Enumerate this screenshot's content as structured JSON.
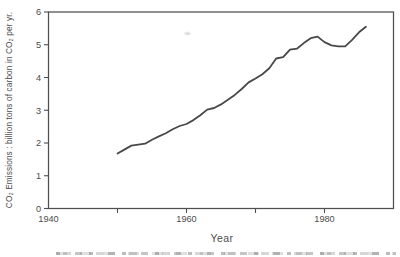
{
  "colors": {
    "paper": "#ffffff",
    "ink": "#4c4c4c",
    "frame": "#4f4f4f",
    "line": "#383838"
  },
  "chart_data": {
    "type": "line",
    "title": "",
    "xlabel": "Year",
    "ylabel": "CO₂ Emissions : billion tons of carbon in CO₂ per yr.",
    "series_name": "Global CO₂ emissions",
    "xlim": [
      1940,
      1990
    ],
    "ylim": [
      0,
      6
    ],
    "grid": false,
    "legend": false,
    "x_tick_labels": [
      "1940",
      "1960",
      "1980"
    ],
    "x_minor_ticks": [
      1950,
      1960,
      1970,
      1980
    ],
    "y_ticks": [
      0,
      1,
      2,
      3,
      4,
      5,
      6
    ],
    "x": [
      1950,
      1951,
      1952,
      1953,
      1954,
      1955,
      1956,
      1957,
      1958,
      1959,
      1960,
      1961,
      1962,
      1963,
      1964,
      1965,
      1966,
      1967,
      1968,
      1969,
      1970,
      1971,
      1972,
      1973,
      1974,
      1975,
      1976,
      1977,
      1978,
      1979,
      1980,
      1981,
      1982,
      1983,
      1984,
      1985,
      1986
    ],
    "y": [
      1.68,
      1.8,
      1.92,
      1.95,
      1.98,
      2.1,
      2.2,
      2.3,
      2.42,
      2.52,
      2.58,
      2.7,
      2.85,
      3.02,
      3.07,
      3.18,
      3.32,
      3.47,
      3.65,
      3.85,
      3.97,
      4.1,
      4.28,
      4.58,
      4.62,
      4.85,
      4.88,
      5.05,
      5.2,
      5.25,
      5.08,
      4.98,
      4.95,
      4.95,
      5.15,
      5.38,
      5.55
    ]
  }
}
